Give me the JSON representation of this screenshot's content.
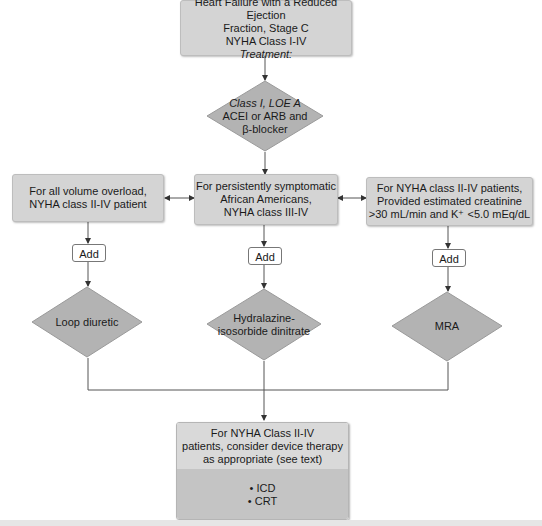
{
  "colors": {
    "box_fill": "#d4d4d4",
    "diamond_fill": "#b3b3b3",
    "device_top_fill": "#d9d9d9",
    "device_bottom_fill": "#c4c4c4",
    "line": "#555555"
  },
  "header_box": {
    "line1": "Heart Failure with a Reduced Ejection",
    "line2": "Fraction, Stage C",
    "line3": "NYHA Class I-IV",
    "line4": "Treatment:"
  },
  "first_decision": {
    "line1": "Class I, LOE A",
    "line2": "ACEI or ARB and",
    "line3": "β-blocker"
  },
  "branches": [
    {
      "condition": [
        "For all volume overload,",
        "NYHA class II-IV patient"
      ],
      "add_label": "Add",
      "therapy": [
        "Loop diuretic"
      ]
    },
    {
      "condition": [
        "For persistently symptomatic",
        "African Americans,",
        "NYHA class III-IV"
      ],
      "add_label": "Add",
      "therapy": [
        "Hydralazine-",
        "isosorbide dinitrate"
      ]
    },
    {
      "condition": [
        "For NYHA class II-IV patients,",
        "Provided estimated creatinine",
        ">30 mL/min and K⁺ <5.0 mEq/dL"
      ],
      "add_label": "Add",
      "therapy": [
        "MRA"
      ]
    }
  ],
  "device_box": {
    "line1": "For NYHA Class II-IV",
    "line2": "patients, consider device therapy",
    "line3": "as appropriate (see text)",
    "items": [
      "• ICD",
      "• CRT"
    ]
  }
}
